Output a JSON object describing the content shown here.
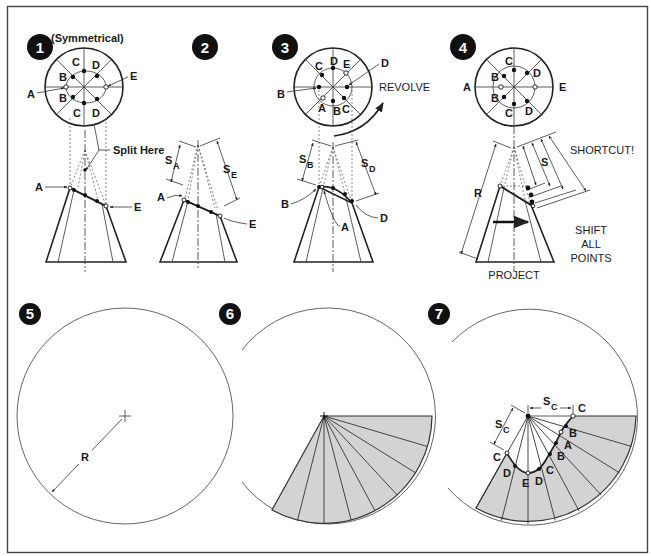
{
  "figure": {
    "colors": {
      "ink": "#222222",
      "fill": "#d3d3d3",
      "background": "#ffffff",
      "frame": "#444444"
    },
    "steps": [
      {
        "number": "1",
        "caption": "(Symmetrical)",
        "labels": {
          "top_view": [
            "C",
            "D",
            "B",
            "E",
            "A",
            "B",
            "C",
            "D"
          ],
          "split": "Split Here",
          "front_left": "A",
          "front_right": "E"
        }
      },
      {
        "number": "2",
        "labels": {
          "s_left": "S",
          "s_left_sub": "A",
          "s_right": "S",
          "s_right_sub": "E",
          "front_left": "A",
          "front_right": "E"
        }
      },
      {
        "number": "3",
        "labels": {
          "top_view": [
            "C",
            "D",
            "E",
            "D",
            "B",
            "A",
            "B",
            "C"
          ],
          "revolve": "REVOLVE",
          "s_left": "S",
          "s_left_sub": "B",
          "s_right": "S",
          "s_right_sub": "D",
          "front_left": "B",
          "front_mid": "A",
          "front_right": "D"
        }
      },
      {
        "number": "4",
        "labels": {
          "top_view": [
            "C",
            "B",
            "D",
            "A",
            "E",
            "B",
            "D",
            "C"
          ],
          "shortcut": "SHORTCUT!",
          "s": "S",
          "r": "R",
          "shift_line1": "SHIFT",
          "shift_line2": "ALL",
          "shift_line3": "POINTS",
          "project": "PROJECT"
        }
      },
      {
        "number": "5",
        "labels": {
          "r": "R"
        }
      },
      {
        "number": "6",
        "labels": {}
      },
      {
        "number": "7",
        "labels": {
          "s_top": "S",
          "s_top_sub": "C",
          "s_left": "S",
          "s_left_sub": "C",
          "points": [
            "C",
            "B",
            "A",
            "B",
            "C",
            "D",
            "E",
            "D",
            "C"
          ]
        }
      }
    ]
  }
}
